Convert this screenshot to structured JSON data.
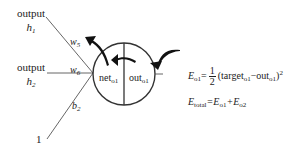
{
  "diagram": {
    "inputs": [
      {
        "label": "output",
        "var": "h",
        "sub": "1",
        "weight": "w",
        "weight_sub": "5"
      },
      {
        "label": "output",
        "var": "h",
        "sub": "2",
        "weight": "w",
        "weight_sub": "6"
      },
      {
        "label": "1",
        "weight": "b",
        "weight_sub": "2"
      }
    ],
    "neuron": {
      "left": {
        "text": "net",
        "sub": "o1"
      },
      "right": {
        "text": "out",
        "sub": "o1"
      }
    },
    "equations": {
      "e1": {
        "lhs": "E",
        "lhs_sub": "o1",
        "eq": "=",
        "num": "1",
        "den": "2",
        "paren_open": "(target",
        "target_sub": "o1",
        "minus": "−out",
        "out_sub": "o1",
        "paren_close": ")",
        "power": "2"
      },
      "e2": {
        "lhs": "E",
        "lhs_sub": "total",
        "eq": "=E",
        "t1_sub": "o1",
        "plus": "+E",
        "t2_sub": "o2"
      }
    },
    "colors": {
      "line": "#444444",
      "arrow": "#111111"
    }
  }
}
